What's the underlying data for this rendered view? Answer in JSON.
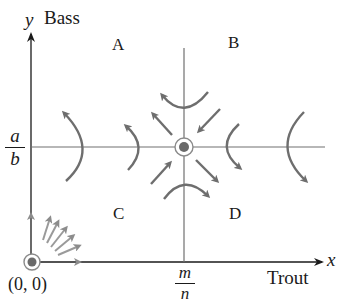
{
  "diagram": {
    "x_axis": {
      "variable": "x",
      "label": "Trout"
    },
    "y_axis": {
      "variable": "y",
      "label": "Bass"
    },
    "x_equilibrium_label": {
      "numerator": "m",
      "denominator": "n"
    },
    "y_equilibrium_label": {
      "numerator": "a",
      "denominator": "b"
    },
    "origin_label": "(0, 0)",
    "regions": [
      {
        "id": "A",
        "label": "A"
      },
      {
        "id": "B",
        "label": "B"
      },
      {
        "id": "C",
        "label": "C"
      },
      {
        "id": "D",
        "label": "D"
      }
    ],
    "equilibria": [
      {
        "name": "origin",
        "label": "(0, 0)"
      },
      {
        "name": "coexistence",
        "label": "(m/n, a/b)"
      }
    ],
    "colors": {
      "axis": "#1a1a1a",
      "nullcline": "#707070",
      "arrow": "#6e6e6e",
      "point_fill": "#6a6a6a",
      "point_ring": "#8a8a8a",
      "origin_arrow": "#9a9a9a"
    }
  }
}
